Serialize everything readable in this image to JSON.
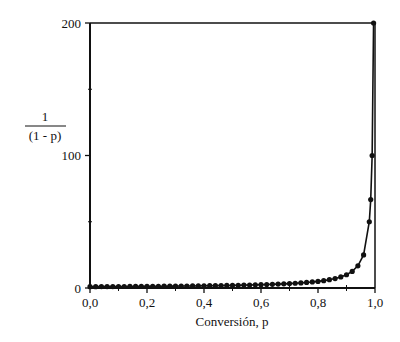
{
  "chart_data": {
    "type": "line",
    "title": "",
    "xlabel": "Conversión, p",
    "ylabel_numerator": "1",
    "ylabel_denominator": "(1 - p)",
    "ylabel": "1/(1 - p)",
    "xlim": [
      0,
      1.0
    ],
    "ylim": [
      0,
      200
    ],
    "x_ticks": [
      "0,0",
      "0,2",
      "0,4",
      "0,6",
      "0,8",
      "1,0"
    ],
    "x_tick_values": [
      0,
      0.2,
      0.4,
      0.6,
      0.8,
      1.0
    ],
    "x_minor_ticks": [
      0.1,
      0.3,
      0.5,
      0.7,
      0.9
    ],
    "y_ticks": [
      "0",
      "100",
      "200"
    ],
    "y_tick_values": [
      0,
      100,
      200
    ],
    "y_minor_ticks": [
      50,
      150
    ],
    "grid": false,
    "legend": null,
    "series": [
      {
        "name": "1/(1-p)",
        "marker": "filled-circle",
        "color": "#111111",
        "x": [
          0.0,
          0.02,
          0.04,
          0.06,
          0.08,
          0.1,
          0.12,
          0.14,
          0.16,
          0.18,
          0.2,
          0.22,
          0.24,
          0.26,
          0.28,
          0.3,
          0.32,
          0.34,
          0.36,
          0.38,
          0.4,
          0.42,
          0.44,
          0.46,
          0.48,
          0.5,
          0.52,
          0.54,
          0.56,
          0.58,
          0.6,
          0.62,
          0.64,
          0.66,
          0.68,
          0.7,
          0.72,
          0.74,
          0.76,
          0.78,
          0.8,
          0.82,
          0.84,
          0.86,
          0.88,
          0.9,
          0.92,
          0.94,
          0.96,
          0.98,
          0.985,
          0.99,
          0.995
        ],
        "y": [
          1.0,
          1.02,
          1.04,
          1.06,
          1.09,
          1.11,
          1.14,
          1.16,
          1.19,
          1.22,
          1.25,
          1.28,
          1.32,
          1.35,
          1.39,
          1.43,
          1.47,
          1.52,
          1.56,
          1.61,
          1.67,
          1.72,
          1.79,
          1.85,
          1.92,
          2.0,
          2.08,
          2.17,
          2.27,
          2.38,
          2.5,
          2.63,
          2.78,
          2.94,
          3.13,
          3.33,
          3.57,
          3.85,
          4.17,
          4.55,
          5.0,
          5.56,
          6.25,
          7.14,
          8.33,
          10.0,
          12.5,
          16.7,
          25.0,
          50.0,
          66.7,
          100.0,
          200.0
        ]
      }
    ]
  }
}
